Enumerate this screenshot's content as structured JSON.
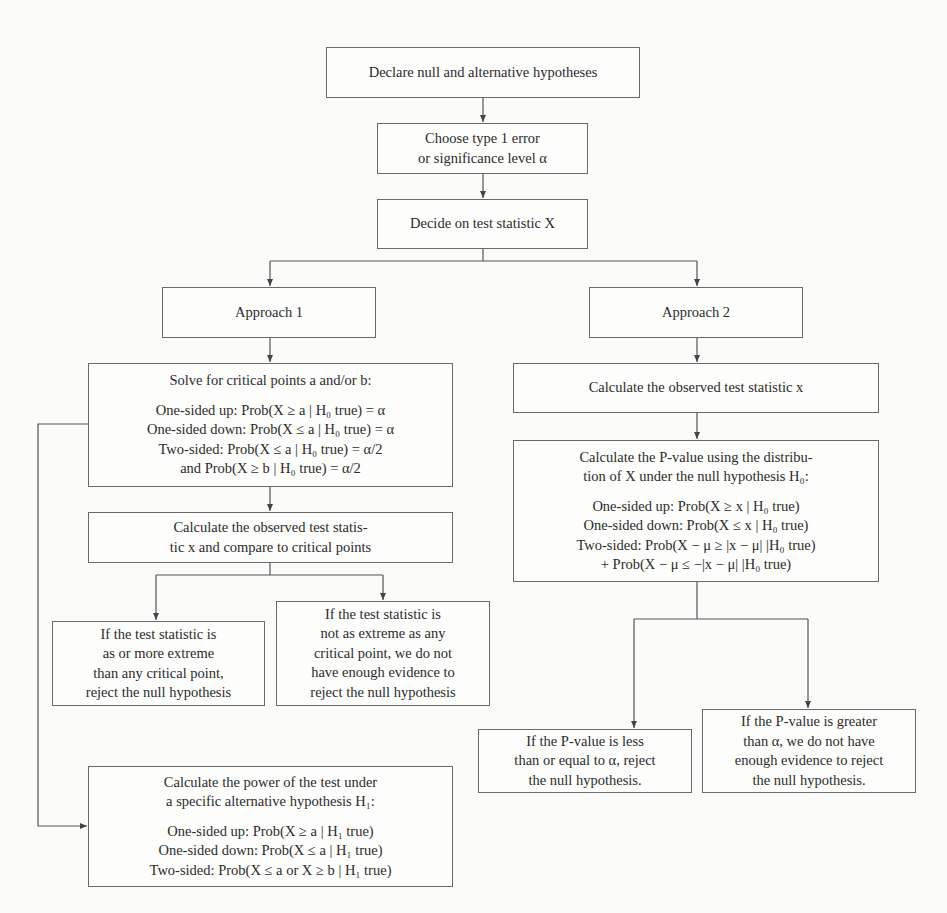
{
  "diagram": {
    "type": "flowchart",
    "colors": {
      "line": "#555555",
      "box_border": "#6a6a6a",
      "text": "#2b2b2b",
      "background": "#fbfbfa"
    },
    "nodes": {
      "declare": {
        "lines": [
          "Declare null and alternative hypotheses"
        ]
      },
      "choose": {
        "lines": [
          "Choose type 1 error",
          "or significance level α"
        ]
      },
      "decide": {
        "lines": [
          "Decide on test statistic X"
        ]
      },
      "approach1": {
        "lines": [
          "Approach 1"
        ]
      },
      "approach2": {
        "lines": [
          "Approach 2"
        ]
      },
      "solve": {
        "heading": "Solve for critical points a and/or b:",
        "lines": [
          "One-sided up: Prob(X  ≥  a | H₀ true) = α",
          "One-sided down: Prob(X  ≤  a | H₀ true) = α",
          "Two-sided: Prob(X  ≤  a | H₀ true) = α/2",
          "and Prob(X  ≥  b | H₀ true)  =  α/2"
        ]
      },
      "calc_compare": {
        "lines": [
          "Calculate the observed test statis-",
          "tic x and compare to critical points"
        ]
      },
      "reject1": {
        "lines": [
          "If the test statistic is",
          "as or more extreme",
          "than any critical point,",
          "reject the null hypothesis"
        ]
      },
      "not_reject1": {
        "lines": [
          "If the test statistic is",
          "not as extreme as any",
          "critical point, we do not",
          "have enough evidence to",
          "reject the null hypothesis"
        ]
      },
      "power": {
        "heading_lines": [
          "Calculate the power of the test under",
          "a specific alternative hypothesis H₁:"
        ],
        "lines": [
          "One-sided up: Prob(X  ≥  a | H₁ true)",
          "One-sided down: Prob(X  ≤  a | H₁ true)",
          "Two-sided: Prob(X ≤ a or X ≥ b | H₁ true)"
        ]
      },
      "observed": {
        "lines": [
          "Calculate the observed test statistic x"
        ]
      },
      "pvalue": {
        "heading_lines": [
          "Calculate the P-value using the distribu-",
          "tion of X under the null hypothesis H₀:"
        ],
        "lines": [
          "One-sided up: Prob(X  ≥  x | H₀ true)",
          "One-sided down: Prob(X  ≤  x | H₀ true)",
          "Two-sided: Prob(X − μ ≥ |x − μ|  |H₀ true)",
          "+ Prob(X − μ  ≤  −|x − μ|  |H₀ true)"
        ]
      },
      "reject2": {
        "lines": [
          "If the P-value is less",
          "than or equal to α, reject",
          "the null hypothesis."
        ]
      },
      "not_reject2": {
        "lines": [
          "If the P-value is greater",
          "than α, we do not have",
          "enough evidence to reject",
          "the null hypothesis."
        ]
      }
    },
    "edges": [
      [
        "declare",
        "choose"
      ],
      [
        "choose",
        "decide"
      ],
      [
        "decide",
        "approach1"
      ],
      [
        "decide",
        "approach2"
      ],
      [
        "approach1",
        "solve"
      ],
      [
        "solve",
        "calc_compare"
      ],
      [
        "calc_compare",
        "reject1"
      ],
      [
        "calc_compare",
        "not_reject1"
      ],
      [
        "solve",
        "power"
      ],
      [
        "approach2",
        "observed"
      ],
      [
        "observed",
        "pvalue"
      ],
      [
        "pvalue",
        "reject2"
      ],
      [
        "pvalue",
        "not_reject2"
      ]
    ]
  }
}
